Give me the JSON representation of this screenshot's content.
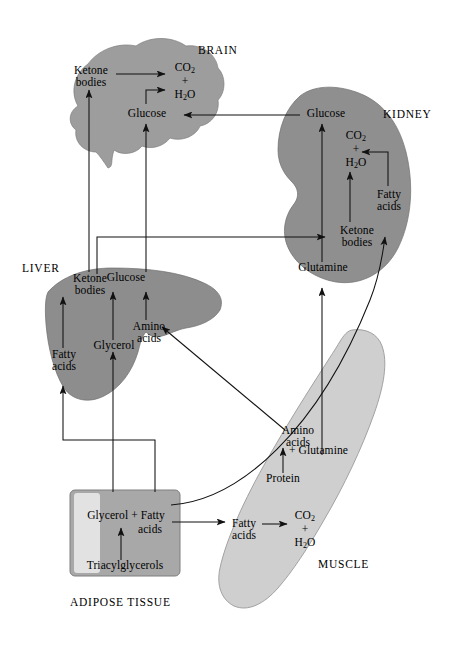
{
  "colors": {
    "brain_fill": "#9d9d9d",
    "kidney_fill": "#8f8f8f",
    "liver_fill": "#8d8d8d",
    "muscle_fill": "#cfcfcf",
    "adipose_dark": "#a8a8a8",
    "adipose_light": "#e2e2e2",
    "stroke": "#111111",
    "background": "#ffffff"
  },
  "organs": {
    "brain": {
      "name": "BRAIN",
      "metabolites": {
        "ketone_bodies": "Ketone\nbodies",
        "ketone_bodies_l1": "Ketone",
        "ketone_bodies_l2": "bodies",
        "co2": "CO",
        "co2_sub": "2",
        "plus": "+",
        "h2o_h": "H",
        "h2o_sub": "2",
        "h2o_o": "O",
        "glucose": "Glucose"
      }
    },
    "kidney": {
      "name": "KIDNEY",
      "metabolites": {
        "glucose": "Glucose",
        "co2": "CO",
        "co2_sub": "2",
        "plus": "+",
        "h2o_h": "H",
        "h2o_sub": "2",
        "h2o_o": "O",
        "fatty_acids_l1": "Fatty",
        "fatty_acids_l2": "acids",
        "ketone_bodies_l1": "Ketone",
        "ketone_bodies_l2": "bodies",
        "glutamine": "Glutamine"
      }
    },
    "liver": {
      "name": "LIVER",
      "metabolites": {
        "ketone_bodies_l1": "Ketone",
        "ketone_bodies_l2": "bodies",
        "glucose": "Glucose",
        "amino_acids_l1": "Amino",
        "amino_acids_l2": "acids",
        "fatty_acids_l1": "Fatty",
        "fatty_acids_l2": "acids",
        "glycerol": "Glycerol"
      }
    },
    "muscle": {
      "name": "MUSCLE",
      "metabolites": {
        "amino_acids_l1": "Amino",
        "amino_acids_l2": "acids",
        "plus_glutamine": "+ Glutamine",
        "protein": "Protein",
        "fatty_acids_l1": "Fatty",
        "fatty_acids_l2": "acids",
        "co2": "CO",
        "co2_sub": "2",
        "plus": "+",
        "h2o_h": "H",
        "h2o_sub": "2",
        "h2o_o": "O"
      }
    },
    "adipose": {
      "name": "ADIPOSE TISSUE",
      "metabolites": {
        "glycerol_fatty": "Glycerol + Fatty",
        "acids": "acids",
        "triacylglycerols": "Triacylglycerols"
      }
    }
  },
  "flows": [
    {
      "id": "kidney-glucose-to-brain-glucose",
      "from": "kidney.glucose",
      "to": "brain.glucose",
      "substance": "Glucose"
    },
    {
      "id": "liver-glucose-to-brain-glucose",
      "from": "liver.glucose",
      "to": "brain.glucose",
      "substance": "Glucose"
    },
    {
      "id": "liver-ketone-to-brain-ketone",
      "from": "liver.ketone_bodies",
      "to": "brain.ketone_bodies",
      "substance": "Ketone bodies"
    },
    {
      "id": "liver-ketone-to-kidney-ketone",
      "from": "liver.ketone_bodies",
      "to": "kidney.ketone_bodies",
      "substance": "Ketone bodies"
    },
    {
      "id": "brain-ketone-to-co2-h2o",
      "from": "brain.ketone_bodies",
      "to": "brain.co2_h2o",
      "substance": "oxidation"
    },
    {
      "id": "brain-glucose-to-h2o",
      "from": "brain.glucose",
      "to": "brain.h2o",
      "substance": "oxidation"
    },
    {
      "id": "kidney-ketone-to-co2-h2o",
      "from": "kidney.ketone_bodies",
      "to": "kidney.co2_h2o",
      "substance": "oxidation"
    },
    {
      "id": "kidney-fatty-to-co2-h2o",
      "from": "kidney.fatty_acids",
      "to": "kidney.co2_h2o",
      "substance": "oxidation"
    },
    {
      "id": "kidney-glutamine-to-glucose",
      "from": "kidney.glutamine",
      "to": "kidney.glucose",
      "substance": "gluconeogenesis"
    },
    {
      "id": "muscle-glutamine-to-kidney-glutamine",
      "from": "muscle.glutamine",
      "to": "kidney.glutamine",
      "substance": "Glutamine"
    },
    {
      "id": "adipose-fatty-to-kidney-fatty",
      "from": "adipose.fatty_acids",
      "to": "kidney.fatty_acids",
      "substance": "Fatty acids"
    },
    {
      "id": "liver-fatty-to-ketone",
      "from": "liver.fatty_acids",
      "to": "liver.ketone_bodies",
      "substance": "ketogenesis"
    },
    {
      "id": "liver-glycerol-to-glucose",
      "from": "liver.glycerol",
      "to": "liver.glucose",
      "substance": "gluconeogenesis"
    },
    {
      "id": "liver-amino-to-glucose",
      "from": "liver.amino_acids",
      "to": "liver.glucose",
      "substance": "gluconeogenesis"
    },
    {
      "id": "muscle-amino-to-liver-amino",
      "from": "muscle.amino_acids",
      "to": "liver.amino_acids",
      "substance": "Amino acids"
    },
    {
      "id": "adipose-glycerol-to-liver-glycerol",
      "from": "adipose.glycerol",
      "to": "liver.glycerol",
      "substance": "Glycerol"
    },
    {
      "id": "adipose-fatty-to-liver-fatty",
      "from": "adipose.fatty_acids",
      "to": "liver.fatty_acids",
      "substance": "Fatty acids"
    },
    {
      "id": "adipose-tag-to-glycerol-fatty",
      "from": "adipose.triacylglycerols",
      "to": "adipose.glycerol_fatty_acids",
      "substance": "lipolysis"
    },
    {
      "id": "adipose-fatty-to-muscle-fatty",
      "from": "adipose.fatty_acids",
      "to": "muscle.fatty_acids",
      "substance": "Fatty acids"
    },
    {
      "id": "muscle-fatty-to-co2-h2o",
      "from": "muscle.fatty_acids",
      "to": "muscle.co2_h2o",
      "substance": "oxidation"
    },
    {
      "id": "muscle-protein-to-amino",
      "from": "muscle.protein",
      "to": "muscle.amino_acids",
      "substance": "proteolysis"
    }
  ]
}
